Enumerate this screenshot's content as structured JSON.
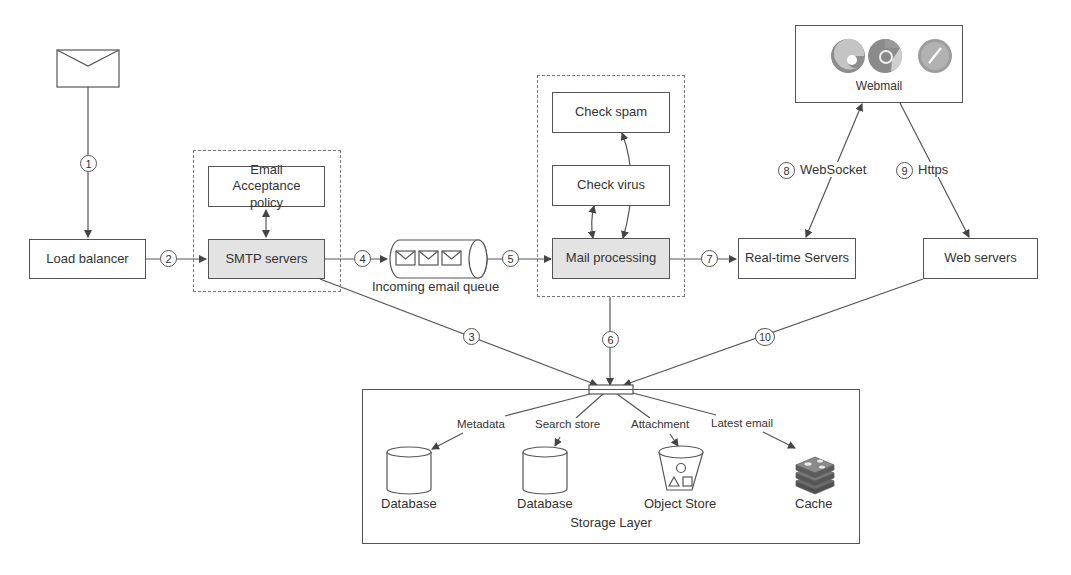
{
  "diagram": {
    "nodes": {
      "email_icon": {
        "label": ""
      },
      "load_balancer": {
        "label": "Load balancer"
      },
      "email_acceptance_policy": {
        "label": "Email Acceptance policy"
      },
      "smtp_servers": {
        "label": "SMTP servers"
      },
      "incoming_queue": {
        "label": "Incoming email queue"
      },
      "check_spam": {
        "label": "Check spam"
      },
      "check_virus": {
        "label": "Check virus"
      },
      "mail_processing": {
        "label": "Mail processing"
      },
      "webmail": {
        "label": "Webmail",
        "browsers": [
          "edge-icon",
          "chrome-icon",
          "safari-icon"
        ]
      },
      "realtime_servers": {
        "label": "Real-time Servers"
      },
      "web_servers": {
        "label": "Web servers"
      },
      "storage_layer": {
        "label": "Storage Layer"
      },
      "metadata_db": {
        "label": "Database"
      },
      "search_db": {
        "label": "Database"
      },
      "object_store": {
        "label": "Object Store"
      },
      "cache": {
        "label": "Cache"
      }
    },
    "steps": [
      "1",
      "2",
      "3",
      "4",
      "5",
      "6",
      "7",
      "8",
      "9",
      "10"
    ],
    "edge_labels": {
      "websocket": "WebSocket",
      "https": "Https",
      "metadata": "Metadata",
      "search_store": "Search store",
      "attachment": "Attachment",
      "latest_email": "Latest email"
    },
    "colors": {
      "line": "#555555",
      "shaded_box": "#e3e3e3",
      "dashed_group": "#777777"
    }
  }
}
